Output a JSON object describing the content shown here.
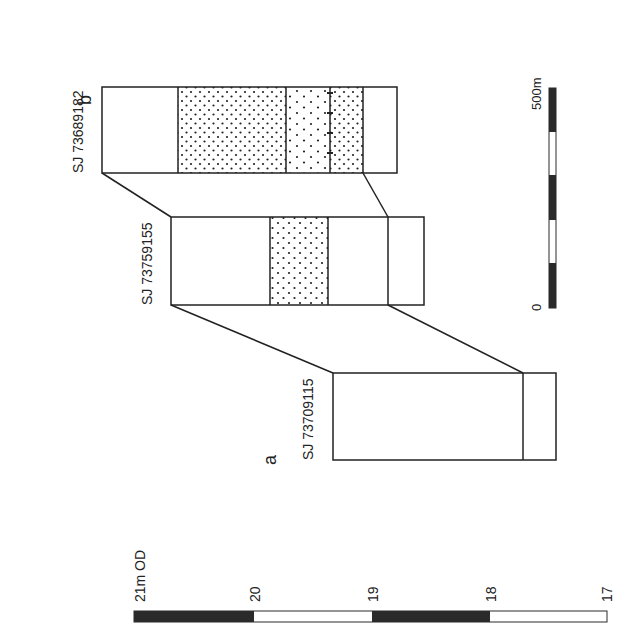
{
  "diagram": {
    "type": "borehole correlation section",
    "orientation": "rotated 90 degrees counter-clockwise",
    "boreholes": [
      {
        "id": "a",
        "letter": "a",
        "grid_ref": "SJ 73709115"
      },
      {
        "id": "b_mid",
        "letter": "",
        "grid_ref": "SJ 73759155"
      },
      {
        "id": "b",
        "letter": "b",
        "grid_ref": "SJ 73689182"
      }
    ],
    "height_scale": {
      "label_top": "21m OD",
      "ticks": [
        "20",
        "19",
        "18",
        "17"
      ]
    },
    "distance_scale": {
      "start": "0",
      "end": "500m"
    },
    "colors": {
      "line": "#222222",
      "scale_dark": "#2a2a2a",
      "background": "#ffffff"
    }
  }
}
